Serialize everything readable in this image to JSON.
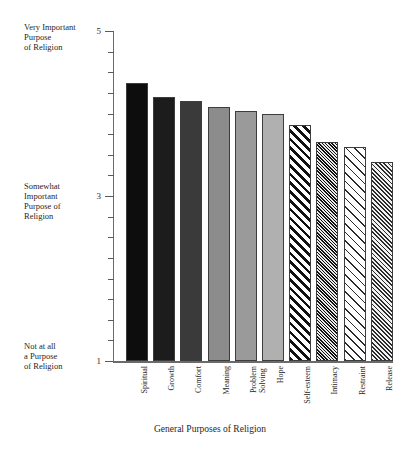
{
  "chart_data": {
    "type": "bar",
    "title": "",
    "xlabel": "General Purposes of Religion",
    "ylabel": "",
    "ylim": [
      1,
      5
    ],
    "grid": false,
    "legend": "none",
    "categories": [
      "Spiritual",
      "Growth",
      "Comfort",
      "Meaning",
      "Problem\nSolving",
      "Hope",
      "Self-esteem",
      "Intimacy",
      "Restraint",
      "Release"
    ],
    "values": [
      4.37,
      4.2,
      4.15,
      4.08,
      4.03,
      3.99,
      3.86,
      3.65,
      3.59,
      3.41
    ],
    "y_tick_labels": [
      "5",
      "3",
      "1"
    ],
    "y_tick_values": [
      5,
      3,
      1
    ],
    "y_minor_ticks": [
      4.75,
      4.5,
      4.25,
      4.0,
      3.75,
      3.5,
      3.25,
      2.75,
      2.5,
      2.25,
      2.0,
      1.75,
      1.5,
      1.25
    ],
    "y_anchor_labels": [
      "Very Important\nPurpose\nof Religion",
      "Somewhat\nImportant\nPurpose of\nReligion",
      "Not at all\na Purpose\nof Religion"
    ],
    "bar_styles": [
      {
        "name": "Spiritual",
        "fill": "#0d0d0d",
        "pattern": "solid"
      },
      {
        "name": "Growth",
        "fill": "#1c1c1c",
        "pattern": "solid"
      },
      {
        "name": "Comfort",
        "fill": "#3a3a3a",
        "pattern": "solid"
      },
      {
        "name": "Meaning",
        "fill": "#8c8c8c",
        "pattern": "solid"
      },
      {
        "name": "Problem Solving",
        "fill": "#9a9a9a",
        "pattern": "solid"
      },
      {
        "name": "Hope",
        "fill": "#b0b0b0",
        "pattern": "solid"
      },
      {
        "name": "Self-esteem",
        "fill": "#ffffff",
        "pattern": "diagonal-stripe-bold"
      },
      {
        "name": "Intimacy",
        "fill": "#2e2e2e",
        "pattern": "crosshatch-dense"
      },
      {
        "name": "Restraint",
        "fill": "#ffffff",
        "pattern": "diagonal-stripe-light"
      },
      {
        "name": "Release",
        "fill": "#6f6f6f",
        "pattern": "crosshatch-medium"
      }
    ],
    "colors": {
      "axis": "#6b6b6b",
      "text": "#1f1f1f",
      "background": "#ffffff"
    }
  }
}
